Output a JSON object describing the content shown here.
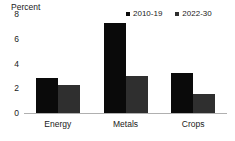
{
  "chart_data": {
    "type": "bar",
    "title": "",
    "subtitle": "",
    "xlabel": "",
    "ylabel": "Percent",
    "categories": [
      "Energy",
      "Metals",
      "Crops"
    ],
    "series": [
      {
        "name": "2010-19",
        "color": "#0a0a0a",
        "values": [
          2.8,
          7.3,
          3.2
        ]
      },
      {
        "name": "2022-30",
        "color": "#2f2f2f",
        "values": [
          2.3,
          3.0,
          1.5
        ]
      }
    ],
    "ylim": [
      0,
      8
    ],
    "yticks": [
      0,
      2,
      4,
      6,
      8
    ],
    "ytick_labels": [
      "0",
      "2",
      "4",
      "6",
      "8"
    ],
    "grid": false,
    "legend_position": "top-right",
    "legend_marker": "square"
  }
}
